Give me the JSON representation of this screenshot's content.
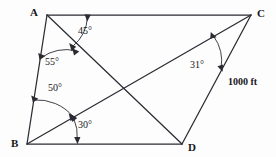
{
  "figure": {
    "type": "geometry-diagram",
    "shape": "parallelogram-with-diagonals",
    "background_color": "#fdfdfd",
    "stroke_color": "#2b2b33",
    "text_color": "#17171c",
    "width": 276,
    "height": 157
  },
  "vertices": [
    {
      "id": "A",
      "label": "A",
      "x": 47,
      "y": 15,
      "label_x": 30,
      "label_y": 7
    },
    {
      "id": "C",
      "label": "C",
      "x": 251,
      "y": 15,
      "label_x": 257,
      "label_y": 8
    },
    {
      "id": "B",
      "label": "B",
      "x": 27,
      "y": 144,
      "label_x": 11,
      "label_y": 138
    },
    {
      "id": "D",
      "label": "D",
      "x": 182,
      "y": 144,
      "label_x": 188,
      "label_y": 142
    }
  ],
  "edges": [
    {
      "name": "side-AC",
      "from": "A",
      "to": "C"
    },
    {
      "name": "side-AB",
      "from": "A",
      "to": "B"
    },
    {
      "name": "side-BD",
      "from": "B",
      "to": "D"
    },
    {
      "name": "side-CD",
      "from": "C",
      "to": "D"
    },
    {
      "name": "diagonal-AD",
      "from": "A",
      "to": "D"
    },
    {
      "name": "diagonal-BC",
      "from": "B",
      "to": "C"
    }
  ],
  "intersection": {
    "name": "diagonal-crossing",
    "x": 130,
    "y": 87
  },
  "angles": [
    {
      "id": "angle-45",
      "value": 45,
      "label": "45°",
      "vertex": "A",
      "between": [
        "side-AC",
        "diagonal-AD"
      ],
      "label_x": 78,
      "label_y": 26
    },
    {
      "id": "angle-55",
      "value": 55,
      "label": "55°",
      "vertex": "A",
      "between": [
        "side-AB",
        "diagonal-AD"
      ],
      "label_x": 45,
      "label_y": 57
    },
    {
      "id": "angle-50",
      "value": 50,
      "label": "50°",
      "vertex": "B",
      "between": [
        "side-AB",
        "diagonal-BC"
      ],
      "label_x": 48,
      "label_y": 83
    },
    {
      "id": "angle-30",
      "value": 30,
      "label": "30°",
      "vertex": "B",
      "between": [
        "diagonal-BC",
        "side-BD"
      ],
      "label_x": 78,
      "label_y": 120
    },
    {
      "id": "angle-31",
      "value": 31,
      "label": "31°",
      "vertex": "C",
      "between": [
        "diagonal-BC",
        "side-CD"
      ],
      "label_x": 190,
      "label_y": 60
    }
  ],
  "measurements": [
    {
      "id": "length-CD",
      "label": "1000 ft",
      "value": 1000,
      "unit": "ft",
      "applies_to": "side-CD",
      "label_x": 228,
      "label_y": 77
    }
  ]
}
